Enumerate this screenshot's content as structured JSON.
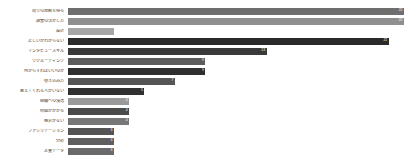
{
  "chart_data": {
    "type": "bar",
    "orientation": "horizontal",
    "title": "",
    "subtitle": "",
    "xlabel": "",
    "ylabel": "",
    "grid": false,
    "legend": null,
    "xlim": [
      0,
      22
    ],
    "categories": [
      "周りの理解を得る",
      "調査の活かし方",
      "設計",
      "正しいかわからない",
      "インタビュースキル",
      "リクルーティング",
      "何からすればいいのか",
      "巻き込み方",
      "教えてくれる人がいない",
      "組織への浸透",
      "時間がかかる",
      "機会がない",
      "ファシリテーション",
      "分析",
      "定量データ"
    ],
    "values": [
      22,
      22,
      3,
      21,
      13,
      9,
      9,
      7,
      5,
      4,
      4,
      4,
      3,
      3,
      3
    ],
    "value_labels": [
      "22",
      "22",
      "",
      "21",
      "13",
      "9",
      "9",
      "7",
      "5",
      "4",
      "4",
      "4",
      "3",
      "3",
      "3"
    ],
    "bar_colors": [
      "#6e6e6e",
      "#8f8f8f",
      "#a6a6a6",
      "#2b2b2b",
      "#3a3a3a",
      "#5c5c5c",
      "#2f2f2f",
      "#555555",
      "#303030",
      "#9a9a9a",
      "#4a4a4a",
      "#777777",
      "#545454",
      "#5f5f5f",
      "#6a6a6a"
    ],
    "label_color": "#3c3c3c",
    "value_text_color": "#ffffff",
    "background": "#ffffff"
  }
}
